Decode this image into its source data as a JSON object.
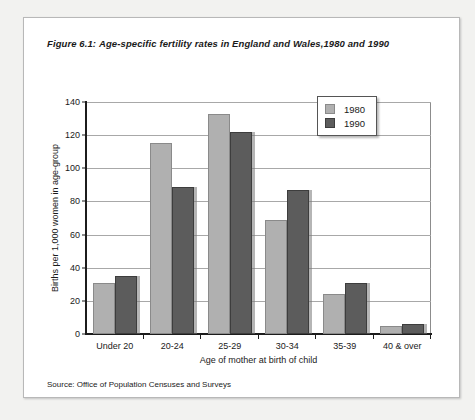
{
  "figure": {
    "number_label": "Figure 6.1:",
    "title": "Age-specific fertility rates in England and Wales,1980 and 1990",
    "source": "Source: Office of Population Censuses and Surveys"
  },
  "legend": {
    "position": "top-right",
    "entries": [
      {
        "label": "1980",
        "color": "#b0b0b0"
      },
      {
        "label": "1990",
        "color": "#5c5c5c"
      }
    ]
  },
  "chart_data": {
    "type": "bar",
    "title": "Age-specific fertility rates in England and Wales,1980 and 1990",
    "xlabel": "Age of mother at birth of child",
    "ylabel": "Births per 1,000 women in age-group",
    "categories": [
      "Under 20",
      "20-24",
      "25-29",
      "30-34",
      "35-39",
      "40 & over"
    ],
    "series": [
      {
        "name": "1980",
        "color": "#b0b0b0",
        "values": [
          31,
          115,
          133,
          69,
          24,
          5
        ]
      },
      {
        "name": "1990",
        "color": "#5c5c5c",
        "values": [
          35,
          89,
          122,
          87,
          31,
          6
        ]
      }
    ],
    "ylim": [
      0,
      140
    ],
    "ytick_step": 20,
    "yticks": [
      0,
      20,
      40,
      60,
      80,
      100,
      120,
      140
    ],
    "ytick_labels": [
      "0",
      "20",
      "40",
      "60",
      "80",
      "100",
      "120",
      "140"
    ],
    "grid": true,
    "legend_position": "top-right"
  }
}
